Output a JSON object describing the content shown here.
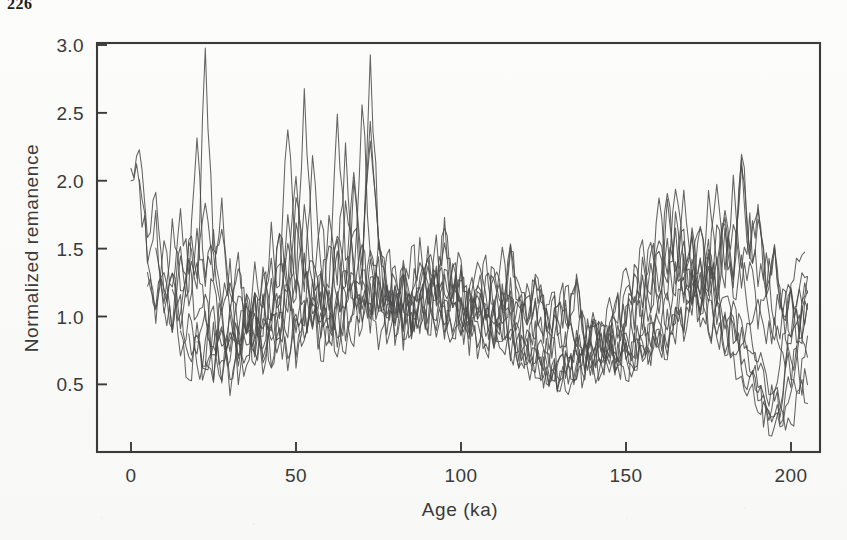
{
  "page": {
    "number": "226"
  },
  "figure": {
    "background_color": "#fbfbfa",
    "line_color": "#4a4a4a",
    "frame_color": "#3b3b3b"
  },
  "chart_data": {
    "type": "line",
    "title": "",
    "xlabel": "Age (ka)",
    "ylabel": "Normalized remanence",
    "xlim": [
      0,
      205
    ],
    "ylim": [
      0.1,
      3.05
    ],
    "xticks": [
      0,
      50,
      100,
      150,
      200
    ],
    "xtick_labels": [
      "0",
      "50",
      "100",
      "150",
      "200"
    ],
    "yticks": [
      0.5,
      1.0,
      1.5,
      2.0,
      2.5,
      3.0
    ],
    "ytick_labels": [
      "0.5",
      "1.0",
      "1.5",
      "2.0",
      "2.5",
      "3.0"
    ],
    "grid": false,
    "legend": false,
    "legend_position": "none",
    "n_series": 12,
    "x_step_ka": 2.5,
    "series": [
      {
        "name": "core-1",
        "x_start": 0,
        "values": [
          2.05,
          1.96,
          1.42,
          1.05,
          1.22,
          0.92,
          1.48,
          1.18,
          2.34,
          1.3,
          1.62,
          1.08,
          1.4,
          0.86,
          1.12,
          0.74,
          0.96,
          0.66,
          0.88,
          0.72,
          1.02,
          0.8,
          1.18,
          0.7,
          0.92,
          1.45,
          1.06,
          1.66,
          1.22,
          2.88,
          1.54,
          1.18,
          0.92,
          1.26,
          0.84,
          1.16,
          1.42,
          1.08,
          1.58,
          1.1,
          1.34,
          0.88,
          1.2,
          0.96,
          1.3,
          1.02,
          1.48,
          1.16,
          0.94,
          1.28,
          1.06,
          0.82,
          1.14,
          0.9,
          1.22,
          0.76,
          0.98,
          0.7,
          0.86,
          0.62,
          0.74,
          0.58,
          0.8,
          0.66,
          0.92,
          0.72,
          1.04,
          0.84,
          1.26,
          0.98,
          1.46,
          1.12,
          1.68,
          1.24,
          2.06,
          1.4,
          1.72,
          1.18,
          1.48,
          0.96,
          1.18,
          0.84,
          1.04,
          0.74,
          0.62,
          0.46,
          0.34,
          0.28,
          0.52,
          0.96,
          1.44,
          1.78
        ]
      },
      {
        "name": "core-2",
        "x_start": 0,
        "values": [
          2.1,
          2.24,
          1.58,
          1.88,
          1.12,
          1.34,
          0.98,
          1.56,
          1.24,
          2.94,
          1.46,
          1.88,
          1.16,
          1.44,
          0.9,
          1.2,
          0.72,
          1.02,
          0.84,
          1.26,
          0.66,
          1.1,
          0.88,
          1.34,
          1.02,
          1.58,
          1.2,
          2.1,
          1.36,
          2.46,
          1.62,
          1.24,
          0.98,
          1.38,
          0.88,
          1.24,
          1.5,
          1.14,
          1.7,
          1.18,
          1.42,
          0.94,
          1.26,
          1.0,
          1.36,
          1.08,
          1.54,
          1.22,
          0.98,
          1.34,
          1.1,
          0.86,
          1.18,
          0.94,
          1.28,
          0.8,
          1.02,
          0.74,
          0.9,
          0.66,
          0.78,
          0.6,
          0.84,
          0.7,
          0.96,
          0.76,
          1.08,
          0.88,
          1.3,
          1.02,
          1.52,
          1.16,
          1.74,
          1.28,
          2.22,
          1.46,
          1.8,
          1.22,
          1.54,
          1.0,
          1.22,
          0.88,
          1.08,
          0.78,
          0.66,
          0.5,
          0.36,
          0.3,
          0.56,
          1.0,
          1.5,
          1.72
        ]
      },
      {
        "name": "core-3",
        "x_start": 2.5,
        "values": [
          1.98,
          1.44,
          1.76,
          1.06,
          1.3,
          0.94,
          1.5,
          1.2,
          1.84,
          1.28,
          1.6,
          1.04,
          1.36,
          0.84,
          1.14,
          0.7,
          0.98,
          0.8,
          1.22,
          0.64,
          1.06,
          0.86,
          1.3,
          1.0,
          1.54,
          1.18,
          1.96,
          1.32,
          2.34,
          1.56,
          1.2,
          0.96,
          1.34,
          0.86,
          1.2,
          1.46,
          1.1,
          1.64,
          1.14,
          1.38,
          0.92,
          1.22,
          0.98,
          1.32,
          1.04,
          1.5,
          1.18,
          0.96,
          1.3,
          1.08,
          0.84,
          1.16,
          0.92,
          1.24,
          0.78,
          1.0,
          0.72,
          0.88,
          0.64,
          0.76,
          0.58,
          0.82,
          0.68,
          0.94,
          0.74,
          1.06,
          0.86,
          1.28,
          1.0,
          1.48,
          1.14,
          1.7,
          1.26,
          2.14,
          1.42,
          1.76,
          1.2,
          1.5,
          0.98,
          1.2,
          0.86,
          1.06,
          0.76,
          0.64,
          0.48,
          0.35,
          0.29,
          0.54,
          0.98,
          1.46,
          1.6
        ]
      },
      {
        "name": "core-4",
        "x_start": 5,
        "values": [
          1.36,
          1.04,
          1.28,
          0.88,
          1.46,
          1.12,
          1.7,
          1.22,
          1.52,
          1.0,
          1.3,
          0.82,
          1.1,
          0.68,
          0.94,
          0.78,
          1.18,
          0.62,
          1.02,
          0.84,
          1.26,
          0.96,
          1.5,
          1.14,
          1.88,
          1.28,
          2.6,
          1.5,
          1.16,
          0.94,
          1.3,
          0.84,
          1.18,
          1.42,
          1.08,
          1.6,
          1.12,
          1.34,
          0.9,
          1.2,
          0.96,
          1.28,
          1.02,
          1.46,
          1.16,
          0.94,
          1.26,
          1.06,
          0.82,
          1.14,
          0.9,
          1.22,
          0.76,
          0.98,
          0.7,
          0.86,
          0.62,
          0.74,
          0.56,
          0.8,
          0.66,
          0.92,
          0.72,
          1.04,
          0.84,
          1.24,
          0.98,
          1.44,
          1.12,
          1.66,
          1.24,
          2.08,
          1.38,
          1.72,
          1.18,
          1.46,
          0.96,
          1.18,
          0.84,
          1.04,
          0.74,
          0.62,
          0.46,
          0.34,
          0.28,
          0.52,
          0.94,
          1.4,
          1.52
        ]
      },
      {
        "name": "core-5",
        "x_start": 5,
        "values": [
          1.22,
          0.96,
          1.6,
          1.18,
          1.84,
          1.26,
          1.44,
          0.98,
          1.24,
          0.8,
          1.06,
          0.66,
          0.92,
          0.76,
          1.14,
          0.6,
          1.0,
          0.82,
          1.22,
          0.94,
          1.46,
          1.1,
          1.74,
          1.24,
          2.28,
          1.44,
          1.12,
          0.92,
          1.26,
          0.82,
          1.14,
          1.38,
          1.06,
          1.56,
          1.1,
          1.3,
          0.88,
          1.18,
          0.94,
          1.26,
          1.0,
          1.42,
          1.14,
          0.92,
          1.24,
          1.04,
          0.8,
          1.12,
          0.88,
          1.2,
          0.74,
          0.96,
          0.68,
          0.84,
          0.6,
          0.72,
          0.55,
          0.78,
          0.64,
          0.9,
          0.7,
          1.02,
          0.82,
          1.22,
          0.96,
          1.42,
          1.1,
          1.62,
          1.22,
          2.0,
          1.36,
          1.68,
          1.16,
          1.44,
          0.94,
          1.16,
          0.82,
          1.02,
          0.72,
          0.6,
          0.45,
          0.33,
          0.27,
          0.5,
          0.92,
          1.36,
          1.46
        ]
      },
      {
        "name": "core-6",
        "x_start": 7.5,
        "values": [
          1.46,
          1.14,
          1.74,
          1.22,
          1.4,
          0.96,
          1.2,
          0.78,
          1.04,
          0.64,
          0.9,
          0.74,
          1.12,
          0.58,
          0.98,
          0.8,
          1.2,
          0.92,
          1.44,
          1.08,
          1.72,
          1.2,
          2.5,
          1.42,
          1.1,
          0.9,
          1.24,
          0.8,
          1.12,
          1.36,
          1.04,
          1.54,
          1.08,
          1.28,
          0.86,
          1.16,
          0.92,
          1.24,
          0.98,
          1.4,
          1.12,
          0.9,
          1.22,
          1.02,
          0.78,
          1.1,
          0.86,
          1.18,
          0.72,
          0.94,
          0.66,
          0.82,
          0.58,
          0.7,
          0.54,
          0.76,
          0.62,
          0.88,
          0.68,
          1.0,
          0.8,
          1.2,
          0.94,
          1.4,
          1.08,
          1.58,
          1.2,
          1.94,
          1.34,
          1.64,
          1.14,
          1.42,
          0.92,
          1.14,
          0.8,
          1.0,
          0.7,
          0.58,
          0.44,
          0.32,
          0.26,
          0.48,
          0.9,
          1.32,
          1.4
        ]
      },
      {
        "name": "core-7",
        "x_start": 10,
        "values": [
          1.08,
          0.86,
          1.16,
          0.7,
          0.96,
          0.58,
          0.82,
          0.68,
          1.06,
          0.52,
          0.92,
          0.74,
          1.14,
          0.88,
          1.38,
          1.04,
          1.66,
          1.18,
          2.18,
          1.38,
          1.08,
          0.88,
          1.2,
          0.78,
          1.1,
          1.32,
          1.02,
          1.5,
          1.06,
          1.26,
          0.84,
          1.14,
          0.9,
          1.22,
          0.96,
          1.38,
          1.1,
          0.88,
          1.2,
          1.0,
          0.76,
          1.08,
          0.84,
          1.16,
          0.7,
          0.92,
          0.64,
          0.8,
          0.56,
          0.68,
          0.52,
          0.74,
          0.6,
          0.86,
          0.66,
          0.98,
          0.78,
          1.18,
          0.92,
          1.38,
          1.06,
          1.56,
          1.18,
          1.88,
          1.32,
          1.62,
          1.12,
          1.4,
          0.9,
          1.12,
          0.78,
          0.98,
          0.68,
          0.56,
          0.42,
          0.31,
          0.25,
          0.46,
          0.88,
          1.28,
          1.34
        ]
      },
      {
        "name": "core-8",
        "x_start": 12.5,
        "values": [
          1.18,
          0.72,
          1.0,
          0.6,
          0.86,
          0.7,
          1.1,
          0.54,
          0.94,
          0.76,
          1.18,
          0.9,
          1.42,
          1.06,
          1.7,
          1.2,
          2.7,
          1.4,
          1.1,
          0.9,
          1.22,
          0.8,
          1.12,
          1.34,
          1.04,
          1.52,
          1.08,
          1.28,
          0.86,
          1.16,
          0.92,
          1.24,
          0.98,
          1.4,
          1.12,
          0.9,
          1.22,
          1.02,
          0.78,
          1.1,
          0.86,
          1.18,
          0.72,
          0.94,
          0.66,
          0.82,
          0.58,
          0.7,
          0.54,
          0.76,
          0.62,
          0.88,
          0.68,
          1.0,
          0.8,
          1.2,
          0.94,
          1.4,
          1.08,
          1.58,
          1.2,
          1.96,
          1.34,
          1.66,
          1.16,
          1.44,
          0.94,
          1.16,
          0.82,
          1.02,
          0.72,
          0.6,
          0.46,
          0.34,
          0.28,
          0.5,
          0.9,
          1.3,
          1.44
        ]
      },
      {
        "name": "core-9",
        "x_start": 15,
        "values": [
          0.94,
          0.58,
          0.82,
          0.66,
          1.04,
          0.5,
          0.9,
          0.72,
          1.12,
          0.86,
          1.36,
          1.02,
          1.62,
          1.16,
          2.04,
          1.34,
          1.06,
          0.86,
          1.18,
          0.76,
          1.08,
          1.3,
          1.0,
          1.48,
          1.04,
          1.24,
          0.82,
          1.12,
          0.88,
          1.2,
          0.94,
          1.36,
          1.08,
          0.86,
          1.18,
          0.98,
          0.74,
          1.06,
          0.82,
          1.14,
          0.68,
          0.9,
          0.62,
          0.78,
          0.54,
          0.66,
          0.5,
          0.72,
          0.58,
          0.84,
          0.64,
          0.96,
          0.76,
          1.16,
          0.9,
          1.36,
          1.04,
          1.54,
          1.16,
          1.86,
          1.3,
          1.6,
          1.1,
          1.38,
          0.88,
          1.1,
          0.76,
          0.96,
          0.66,
          0.54,
          0.4,
          0.3,
          0.24,
          0.44,
          0.86,
          1.24,
          1.28
        ]
      },
      {
        "name": "core-10",
        "x_start": 17.5,
        "values": [
          0.88,
          0.7,
          1.08,
          0.52,
          0.92,
          0.74,
          1.16,
          0.88,
          1.4,
          1.04,
          1.68,
          1.18,
          2.4,
          1.36,
          1.08,
          0.88,
          1.2,
          0.78,
          1.1,
          1.32,
          1.02,
          1.5,
          1.06,
          1.26,
          0.84,
          1.14,
          0.9,
          1.22,
          0.96,
          1.38,
          1.1,
          0.88,
          1.2,
          1.0,
          0.76,
          1.08,
          0.84,
          1.16,
          0.7,
          0.92,
          0.64,
          0.8,
          0.56,
          0.68,
          0.52,
          0.74,
          0.6,
          0.86,
          0.66,
          0.98,
          0.78,
          1.18,
          0.92,
          1.38,
          1.06,
          1.56,
          1.18,
          1.9,
          1.32,
          1.64,
          1.14,
          1.42,
          0.92,
          1.14,
          0.8,
          1.0,
          0.7,
          0.58,
          0.44,
          0.32,
          0.26,
          0.48,
          0.88,
          1.26,
          1.38
        ]
      },
      {
        "name": "core-11",
        "x_start": 20,
        "values": [
          0.78,
          0.62,
          0.98,
          0.48,
          0.86,
          0.7,
          1.1,
          0.84,
          1.34,
          1.0,
          1.58,
          1.14,
          1.92,
          1.3,
          1.04,
          0.84,
          1.16,
          0.74,
          1.06,
          1.28,
          0.98,
          1.44,
          1.02,
          1.22,
          0.8,
          1.1,
          0.86,
          1.18,
          0.92,
          1.34,
          1.06,
          0.84,
          1.16,
          0.96,
          0.72,
          1.04,
          0.8,
          1.12,
          0.66,
          0.88,
          0.6,
          0.76,
          0.52,
          0.64,
          0.48,
          0.7,
          0.56,
          0.82,
          0.62,
          0.94,
          0.74,
          1.14,
          0.88,
          1.34,
          1.02,
          1.52,
          1.14,
          1.82,
          1.28,
          1.58,
          1.08,
          1.36,
          0.86,
          1.08,
          0.74,
          0.94,
          0.64,
          0.52,
          0.38,
          0.29,
          0.23,
          0.42,
          0.84,
          1.2,
          1.22
        ]
      },
      {
        "name": "core-12",
        "x_start": 22.5,
        "values": [
          0.7,
          0.56,
          0.9,
          0.44,
          0.8,
          0.66,
          1.02,
          0.78,
          1.26,
          0.96,
          1.5,
          1.1,
          1.78,
          1.26,
          1.0,
          0.82,
          1.12,
          0.72,
          1.02,
          1.24,
          0.96,
          1.4,
          1.0,
          1.2,
          0.78,
          1.08,
          0.84,
          1.16,
          0.9,
          1.3,
          1.04,
          0.82,
          1.14,
          0.94,
          0.7,
          1.02,
          0.78,
          1.1,
          0.64,
          0.86,
          0.58,
          0.74,
          0.5,
          0.62,
          0.46,
          0.68,
          0.54,
          0.8,
          0.6,
          0.92,
          0.72,
          1.1,
          0.86,
          1.3,
          1.0,
          1.48,
          1.12,
          1.76,
          1.24,
          1.54,
          1.06,
          1.34,
          0.84,
          1.06,
          0.72,
          0.92,
          0.62,
          0.5,
          0.36,
          0.28,
          0.22,
          0.4,
          0.82,
          1.16,
          1.18
        ]
      }
    ]
  }
}
